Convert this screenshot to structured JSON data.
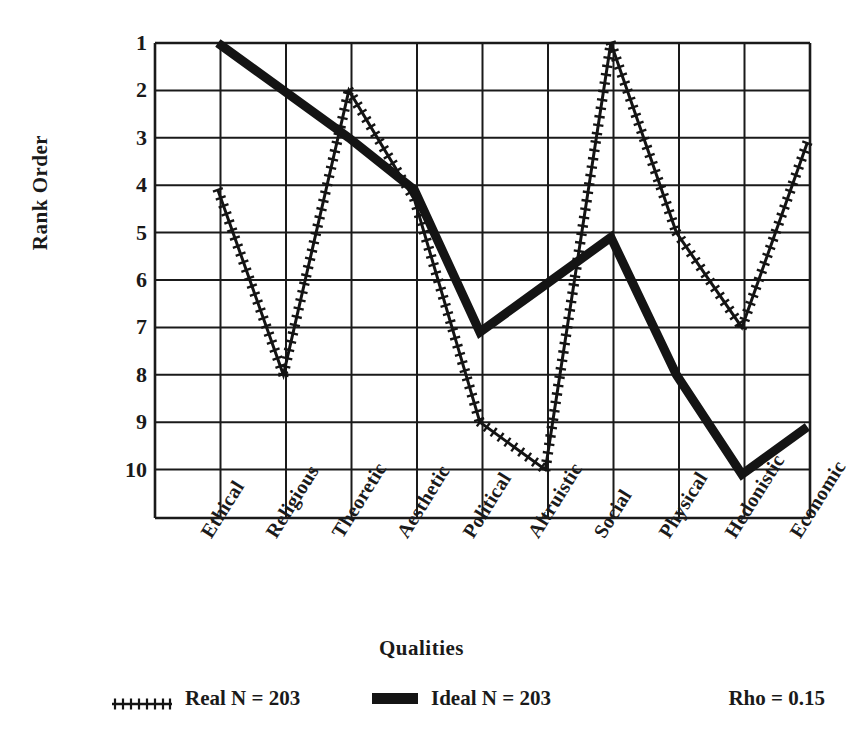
{
  "chart_data": {
    "type": "line",
    "title": "",
    "xlabel": "Qualities",
    "ylabel": "Rank Order",
    "categories": [
      "Ethical",
      "Religious",
      "Theoretic",
      "Aesthetic",
      "Political",
      "Altruistic",
      "Social",
      "Physical",
      "Hedonistic",
      "Economic"
    ],
    "ylim": [
      1,
      10
    ],
    "y_inverted": true,
    "yticks": [
      1,
      2,
      3,
      4,
      5,
      6,
      7,
      8,
      9,
      10
    ],
    "grid": true,
    "legend_position": "bottom",
    "series": [
      {
        "name": "Real  N = 203",
        "style": "hatched-line",
        "values": [
          4.1,
          8.0,
          2.0,
          4.3,
          9.0,
          10.0,
          1.0,
          5.0,
          7.0,
          3.1
        ]
      },
      {
        "name": "Ideal  N = 203",
        "style": "thick-solid-line",
        "values": [
          1.0,
          2.0,
          3.0,
          4.1,
          7.1,
          6.1,
          5.1,
          8.0,
          10.1,
          9.1
        ]
      }
    ],
    "annotations": [
      {
        "name": "rho",
        "text": "Rho = 0.15",
        "value": 0.15
      }
    ]
  },
  "axes": {
    "y_title": "Rank Order",
    "x_title": "Qualities",
    "y_tick_labels": [
      "1",
      "2",
      "3",
      "4",
      "5",
      "6",
      "7",
      "8",
      "9",
      "10"
    ],
    "x_tick_labels": [
      "Ethical",
      "Religious",
      "Theoretic",
      "Aesthetic",
      "Political",
      "Altruistic",
      "Social",
      "Physical",
      "Hedonistic",
      "Economic"
    ]
  },
  "legend": {
    "real_label": "Real  N = 203",
    "ideal_label": "Ideal  N = 203",
    "rho_label": "Rho = 0.15"
  },
  "colors": {
    "line": "#141414",
    "grid": "#1a1a1a",
    "background": "#ffffff"
  }
}
